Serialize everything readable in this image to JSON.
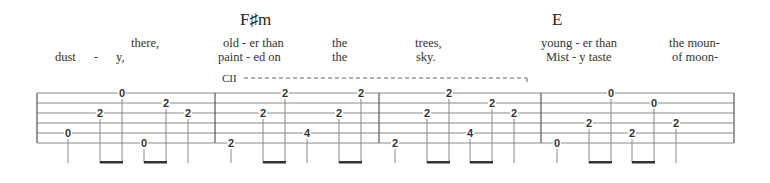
{
  "chords": [
    {
      "name": "F♯m",
      "x": 240,
      "y": 10
    },
    {
      "name": "E",
      "x": 552,
      "y": 10
    }
  ],
  "lyrics": {
    "line1": [
      {
        "text": "there,",
        "x": 131
      },
      {
        "text": "old - er than",
        "x": 223
      },
      {
        "text": "the",
        "x": 332
      },
      {
        "text": "trees,",
        "x": 415
      },
      {
        "text": "young - er than",
        "x": 541
      },
      {
        "text": "the moun-",
        "x": 669
      }
    ],
    "line2": [
      {
        "text": "dust",
        "x": 55
      },
      {
        "text": "-",
        "x": 94
      },
      {
        "text": "y,",
        "x": 116
      },
      {
        "text": "paint - ed on",
        "x": 218
      },
      {
        "text": "the",
        "x": 332
      },
      {
        "text": "sky.",
        "x": 416
      },
      {
        "text": "Mist - y taste",
        "x": 546
      },
      {
        "text": "of moon-",
        "x": 672
      }
    ]
  },
  "barre": {
    "label": "CII",
    "x_start": 222,
    "x_end": 527,
    "y": 80
  },
  "staff": {
    "x_start": 37,
    "x_end": 734,
    "string_y": [
      93,
      103,
      113,
      123,
      133,
      143
    ],
    "barlines": [
      37,
      215,
      379,
      541,
      734
    ]
  },
  "tab_notes": [
    {
      "measure": 1,
      "fret": "0",
      "string": 5,
      "x": 68
    },
    {
      "measure": 1,
      "fret": "2",
      "string": 3,
      "x": 100
    },
    {
      "measure": 1,
      "fret": "0",
      "string": 1,
      "x": 122
    },
    {
      "measure": 1,
      "fret": "0",
      "string": 6,
      "x": 144
    },
    {
      "measure": 1,
      "fret": "2",
      "string": 2,
      "x": 166
    },
    {
      "measure": 1,
      "fret": "2",
      "string": 3,
      "x": 188
    },
    {
      "measure": 2,
      "fret": "2",
      "string": 6,
      "x": 231
    },
    {
      "measure": 2,
      "fret": "2",
      "string": 3,
      "x": 263
    },
    {
      "measure": 2,
      "fret": "2",
      "string": 1,
      "x": 285
    },
    {
      "measure": 2,
      "fret": "4",
      "string": 5,
      "x": 307
    },
    {
      "measure": 2,
      "fret": "2",
      "string": 3,
      "x": 339
    },
    {
      "measure": 2,
      "fret": "2",
      "string": 1,
      "x": 361
    },
    {
      "measure": 3,
      "fret": "2",
      "string": 6,
      "x": 395
    },
    {
      "measure": 3,
      "fret": "2",
      "string": 3,
      "x": 427
    },
    {
      "measure": 3,
      "fret": "2",
      "string": 1,
      "x": 449
    },
    {
      "measure": 3,
      "fret": "4",
      "string": 5,
      "x": 470
    },
    {
      "measure": 3,
      "fret": "2",
      "string": 2,
      "x": 492
    },
    {
      "measure": 3,
      "fret": "2",
      "string": 3,
      "x": 514
    },
    {
      "measure": 4,
      "fret": "0",
      "string": 6,
      "x": 557
    },
    {
      "measure": 4,
      "fret": "2",
      "string": 4,
      "x": 589
    },
    {
      "measure": 4,
      "fret": "0",
      "string": 1,
      "x": 611
    },
    {
      "measure": 4,
      "fret": "2",
      "string": 5,
      "x": 632
    },
    {
      "measure": 4,
      "fret": "0",
      "string": 2,
      "x": 654
    },
    {
      "measure": 4,
      "fret": "2",
      "string": 4,
      "x": 676
    }
  ],
  "stems": {
    "bottom_y": 163
  },
  "beams": [
    {
      "x1": 100,
      "x2": 122
    },
    {
      "x1": 144,
      "x2": 166
    },
    {
      "x1": 263,
      "x2": 285
    },
    {
      "x1": 339,
      "x2": 361
    },
    {
      "x1": 427,
      "x2": 449
    },
    {
      "x1": 470,
      "x2": 492
    },
    {
      "x1": 589,
      "x2": 611
    },
    {
      "x1": 632,
      "x2": 654
    }
  ],
  "colors": {
    "line": "#777777",
    "text": "#222222",
    "beam": "#333333"
  }
}
